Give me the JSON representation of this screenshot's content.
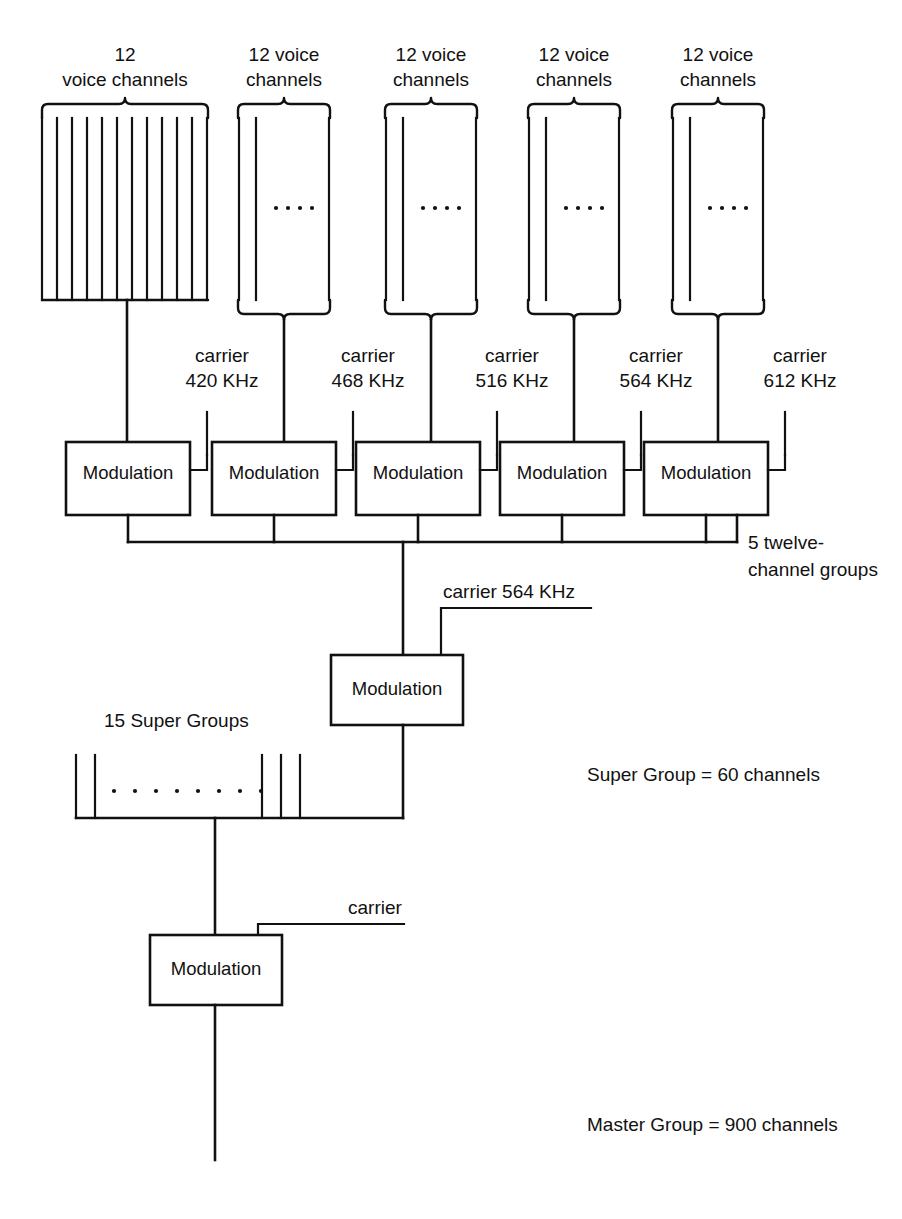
{
  "diagram": {
    "background_color": "#ffffff",
    "line_color": "#111111"
  },
  "channel_groups": [
    {
      "id": "group-1",
      "label_line1": "12",
      "label_line2": "voice channels",
      "channel_count": 12,
      "drawn_lines": 12,
      "has_dots": false,
      "x": 42,
      "width": 166,
      "top": 118,
      "bottom": 300,
      "tap_x": 127
    },
    {
      "id": "group-2",
      "label_line1": "12 voice",
      "label_line2": "channels",
      "channel_count": 12,
      "drawn_lines": 3,
      "has_dots": true,
      "dots": 4,
      "x": 238,
      "width": 92,
      "top": 118,
      "bottom": 300,
      "tap_x": 284
    },
    {
      "id": "group-3",
      "label_line1": "12 voice",
      "label_line2": "channels",
      "channel_count": 12,
      "drawn_lines": 3,
      "has_dots": true,
      "dots": 4,
      "x": 385,
      "width": 92,
      "top": 118,
      "bottom": 300,
      "tap_x": 431
    },
    {
      "id": "group-4",
      "label_line1": "12 voice",
      "label_line2": "channels",
      "channel_count": 12,
      "drawn_lines": 3,
      "has_dots": true,
      "dots": 4,
      "x": 528,
      "width": 92,
      "top": 118,
      "bottom": 300,
      "tap_x": 574
    },
    {
      "id": "group-5",
      "label_line1": "12 voice",
      "label_line2": "channels",
      "channel_count": 12,
      "drawn_lines": 3,
      "has_dots": true,
      "dots": 4,
      "x": 672,
      "width": 92,
      "top": 118,
      "bottom": 300,
      "tap_x": 718
    }
  ],
  "carriers_stage1": [
    {
      "id": "carrier-1",
      "line1": "carrier",
      "line2": "420 KHz",
      "text_x": 222,
      "text_y": 370,
      "lead_x": 210,
      "lead_top": 412,
      "lead_bottom": 455
    },
    {
      "id": "carrier-2",
      "line1": "carrier",
      "line2": "468 KHz",
      "text_x": 368,
      "text_y": 370,
      "lead_x": 356,
      "lead_top": 412,
      "lead_bottom": 455
    },
    {
      "id": "carrier-3",
      "line1": "carrier",
      "line2": "516 KHz",
      "text_x": 512,
      "text_y": 370,
      "lead_x": 500,
      "lead_top": 412,
      "lead_bottom": 455
    },
    {
      "id": "carrier-4",
      "line1": "carrier",
      "line2": "564 KHz",
      "text_x": 656,
      "text_y": 370,
      "lead_x": 644,
      "lead_top": 412,
      "lead_bottom": 455
    },
    {
      "id": "carrier-5",
      "line1": "carrier",
      "line2": "612 KHz",
      "text_x": 800,
      "text_y": 370,
      "lead_x": 788,
      "lead_top": 412,
      "lead_bottom": 455
    }
  ],
  "modulators_stage1": [
    {
      "id": "modulator-1",
      "label": "Modulation",
      "x": 66,
      "y": 442,
      "w": 124,
      "h": 73
    },
    {
      "id": "modulator-2",
      "label": "Modulation",
      "x": 212,
      "y": 442,
      "w": 124,
      "h": 73
    },
    {
      "id": "modulator-3",
      "label": "Modulation",
      "x": 356,
      "y": 442,
      "w": 124,
      "h": 73
    },
    {
      "id": "modulator-4",
      "label": "Modulation",
      "x": 500,
      "y": 442,
      "w": 124,
      "h": 73
    },
    {
      "id": "modulator-5",
      "label": "Modulation",
      "x": 644,
      "y": 442,
      "w": 124,
      "h": 73
    }
  ],
  "bus_stage1": {
    "y": 542,
    "x_start": 128,
    "x_end": 737,
    "note_line1": "5 twelve-",
    "note_line2": "channel groups",
    "note_x": 748,
    "note_y1": 549,
    "note_y2": 575
  },
  "modulator_stage2": {
    "id": "modulator-6",
    "label": "Modulation",
    "x": 331,
    "y": 655,
    "w": 132,
    "h": 70,
    "carrier_label": "carrier 564 KHz",
    "carrier_text_x": 443,
    "carrier_text_y": 592,
    "carrier_lead_x": 441,
    "carrier_lead_x_end": 591,
    "carrier_lead_y": 602,
    "input_x": 403,
    "output_x": 403
  },
  "super_groups": {
    "label": "15 Super Groups",
    "label_x": 104,
    "label_y": 720,
    "left_x": 75,
    "right_x": 400,
    "top": 755,
    "bottom": 818,
    "lines_left": [
      75,
      104
    ],
    "lines_right": [
      271,
      291,
      310
    ],
    "dot_count": 8,
    "dot_start_x": 112,
    "dot_spacing": 21,
    "dot_y": 790,
    "tap_x": 215
  },
  "modulator_stage3": {
    "id": "modulator-7",
    "label": "Modulation",
    "x": 150,
    "y": 935,
    "w": 132,
    "h": 70,
    "carrier_label": "carrier",
    "carrier_text_x": 348,
    "carrier_text_y": 908,
    "carrier_lead_x": 258,
    "carrier_lead_x_end": 404,
    "carrier_lead_y": 918,
    "input_x": 215,
    "output_x": 215,
    "output_bottom": 1160
  },
  "notes": [
    {
      "id": "note-super-group",
      "text": "Super Group  =  60 channels",
      "x": 587,
      "y": 775
    },
    {
      "id": "note-master-group",
      "text": "Master Group  =  900 channels",
      "x": 587,
      "y": 1125
    }
  ]
}
